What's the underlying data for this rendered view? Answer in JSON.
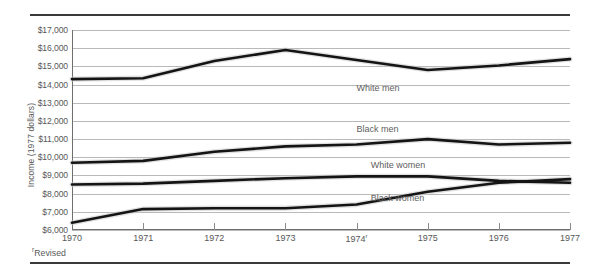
{
  "chart_data": {
    "type": "line",
    "title": "",
    "xlabel": "",
    "ylabel": "Income (1977 dollars)",
    "x": [
      1970,
      1971,
      1972,
      1973,
      1974,
      1975,
      1976,
      1977
    ],
    "xtick_labels": [
      "1970",
      "1971",
      "1972",
      "1973",
      "1974",
      "1975",
      "1976",
      "1977"
    ],
    "xtick_superscripts": [
      "",
      "",
      "",
      "",
      "r",
      "",
      "",
      ""
    ],
    "ylim": [
      6000,
      17000
    ],
    "ytick_values": [
      17000,
      16000,
      15000,
      14000,
      13000,
      12000,
      11000,
      10000,
      9000,
      8000,
      7000,
      6000
    ],
    "ytick_labels": [
      "$17,000",
      "$16,000",
      "$15,000",
      "$14,000",
      "$13,000",
      "$12,000",
      "$11,000",
      "$10,000",
      "$9,000",
      "$8,000",
      "$7,000",
      "$6,000"
    ],
    "grid": true,
    "legend_position": "inline-annotations",
    "series": [
      {
        "name": "White men",
        "label": "White men",
        "color": "#141414",
        "values": [
          14300,
          14350,
          15300,
          15900,
          15350,
          14800,
          15050,
          15400
        ],
        "label_x_year": 1974.0,
        "label_y_value": 13750
      },
      {
        "name": "Black men",
        "label": "Black men",
        "color": "#141414",
        "values": [
          9700,
          9800,
          10300,
          10600,
          10700,
          11000,
          10700,
          10800
        ],
        "label_x_year": 1974.0,
        "label_y_value": 11500
      },
      {
        "name": "White women",
        "label": "White women",
        "color": "#141414",
        "values": [
          8500,
          8550,
          8700,
          8850,
          8950,
          8950,
          8700,
          8600
        ],
        "label_x_year": 1974.2,
        "label_y_value": 9500
      },
      {
        "name": "Black women",
        "label": "Black women",
        "color": "#141414",
        "values": [
          6400,
          7150,
          7200,
          7200,
          7400,
          8100,
          8600,
          8800
        ],
        "label_x_year": 1974.2,
        "label_y_value": 7700
      }
    ],
    "annotations": [
      {
        "name": "revised-footnote",
        "text": "Revised",
        "superscript": "r"
      }
    ]
  }
}
